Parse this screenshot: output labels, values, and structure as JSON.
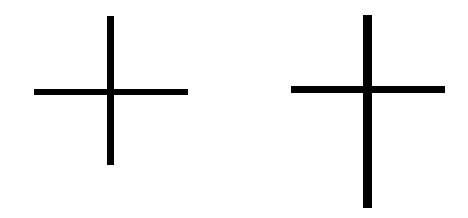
{
  "figure": {
    "background": "#ffffff",
    "stroke_color": "#000000",
    "shapes": [
      {
        "name": "cross-left",
        "vertical": {
          "x": 107,
          "y": 16,
          "w": 7,
          "h": 149
        },
        "horizontal": {
          "x": 34,
          "y": 89,
          "w": 154,
          "h": 6
        }
      },
      {
        "name": "cross-right",
        "vertical": {
          "x": 363,
          "y": 15,
          "w": 9,
          "h": 193
        },
        "horizontal": {
          "x": 291,
          "y": 86,
          "w": 154,
          "h": 7
        }
      }
    ]
  }
}
